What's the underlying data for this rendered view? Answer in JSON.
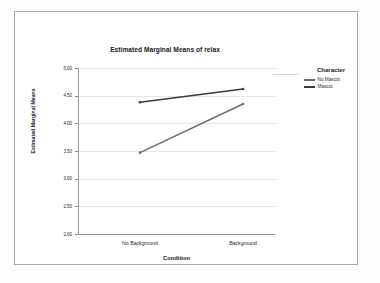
{
  "chart_data": {
    "type": "line",
    "title": "Estimated Marginal Means of relax",
    "xlabel": "Condition",
    "ylabel": "Estimated Marginal Means",
    "categories": [
      "No Background",
      "Background"
    ],
    "ylim": [
      2.0,
      5.0
    ],
    "yticks": [
      "2.00",
      "2.50",
      "3.00",
      "3.50",
      "4.00",
      "4.50",
      "5.00"
    ],
    "ytick_values": [
      2.0,
      2.5,
      3.0,
      3.5,
      4.0,
      4.5,
      5.0
    ],
    "grid": true,
    "legend_position": "right",
    "legend_title": "Character",
    "series": [
      {
        "name": "No Mascot",
        "values": [
          3.47,
          4.35
        ],
        "color": "#6e6e6e"
      },
      {
        "name": "Mascot",
        "values": [
          4.38,
          4.62
        ],
        "color": "#3a3a3a"
      }
    ]
  },
  "colors": {
    "frame_border": "#a9a9a9",
    "axis": "#9a9a9a",
    "gridline": "#e6e6e6",
    "plot_background": "#ffffff",
    "figure_background": "#fdfdfd",
    "text": "#1a1a1a"
  }
}
